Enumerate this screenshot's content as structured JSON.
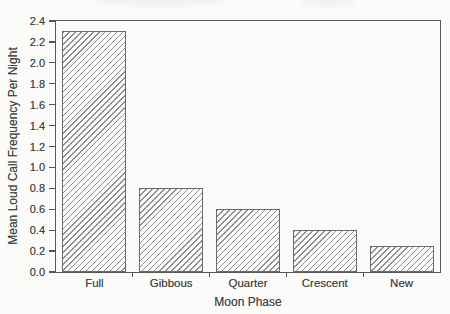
{
  "figure": {
    "background_color": "#fbfbf9",
    "frame_color": "#585858",
    "text_color": "#3f3f3f",
    "bar_fill": "diagonal-hatch",
    "hatch_color": "#8f8f8f"
  },
  "chart_data": {
    "type": "bar",
    "title": "",
    "xlabel": "Moon Phase",
    "ylabel": "Mean Loud Call Frequency Per Night",
    "categories": [
      "Full",
      "Gibbous",
      "Quarter",
      "Crescent",
      "New"
    ],
    "values": [
      2.3,
      0.8,
      0.6,
      0.4,
      0.25
    ],
    "ylim": [
      0,
      2.4
    ],
    "ytick_step": 0.2,
    "ytick_labels": [
      "0.0",
      "0.2",
      "0.4",
      "0.6",
      "0.8",
      "1.0",
      "1.2",
      "1.4",
      "1.6",
      "1.8",
      "2.0",
      "2.2",
      "2.4"
    ],
    "grid": false,
    "legend": null,
    "bar_style": "diagonal-hatch"
  }
}
